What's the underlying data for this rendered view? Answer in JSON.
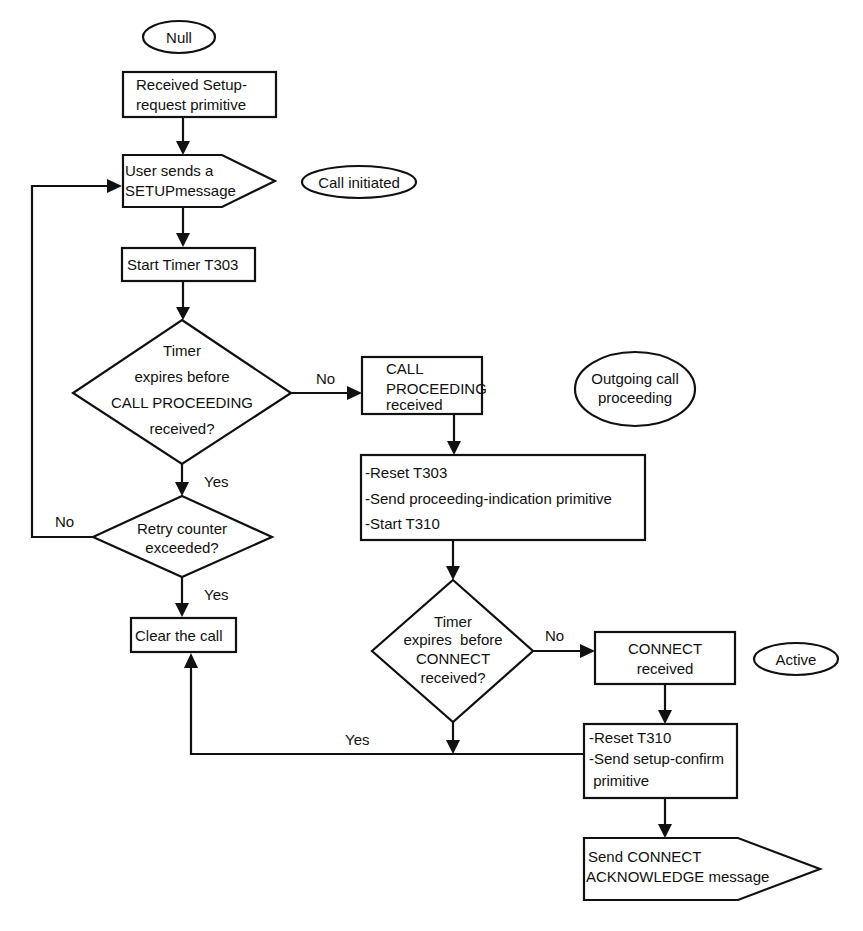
{
  "diagram": {
    "type": "flowchart",
    "colors": {
      "stroke": "#111111",
      "background": "#ffffff",
      "text": "#111111"
    },
    "states": {
      "null": "Null",
      "call_initiated": "Call initiated",
      "outgoing_call_proceeding": [
        "Outgoing call",
        "proceeding"
      ],
      "active": "Active"
    },
    "nodes": {
      "received_setup_request": [
        "Received Setup-",
        "request primitive"
      ],
      "send_setup_message": [
        "User sends a",
        "SETUPmessage"
      ],
      "start_timer_t303": "Start Timer T303",
      "decision_call_proceeding": [
        "Timer",
        "expires before",
        "CALL PROCEEDING",
        "received?"
      ],
      "retry_counter": [
        "Retry counter",
        "exceeded?"
      ],
      "clear_call": "Clear the call",
      "call_proceeding_received": [
        "CALL",
        "PROCEEDING",
        "received"
      ],
      "proceeding_actions": [
        "-Reset T303",
        "-Send proceeding-indication primitive",
        "-Start T310"
      ],
      "decision_connect": [
        "Timer",
        "expires  before",
        "CONNECT",
        "received?"
      ],
      "connect_received": [
        "CONNECT",
        "received"
      ],
      "connect_actions": [
        "-Reset T310",
        "-Send setup-confirm",
        " primitive"
      ],
      "send_connect_ack": [
        "Send CONNECT",
        "ACKNOWLEDGE message"
      ]
    },
    "edge_labels": {
      "d1_no": "No",
      "d1_yes": "Yes",
      "d2_no": "No",
      "d2_yes": "Yes",
      "d3_no": "No",
      "d3_yes": "Yes"
    }
  }
}
